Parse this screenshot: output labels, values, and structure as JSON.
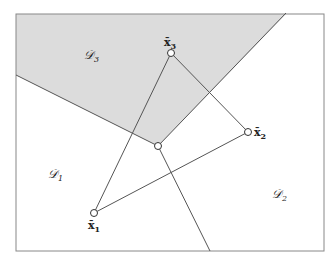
{
  "diagram": {
    "type": "voronoi-decision-regions",
    "frame": {
      "x1": 16,
      "y1": 14,
      "x2": 324,
      "y2": 251
    },
    "colors": {
      "shaded_region": "#dcdcdc",
      "line": "#555555",
      "frame": "#888888",
      "point_fill": "#ffffff"
    },
    "regions": [
      {
        "id": "D1",
        "label": "𝒟",
        "sub": "1",
        "x": 48,
        "y": 178,
        "shaded": false
      },
      {
        "id": "D2",
        "label": "𝒟",
        "sub": "2",
        "x": 272,
        "y": 198,
        "shaded": false
      },
      {
        "id": "D3",
        "label": "𝒟",
        "sub": "3",
        "x": 84,
        "y": 59,
        "shaded": true
      }
    ],
    "points": [
      {
        "id": "x1",
        "label": "x̄",
        "sub": "1",
        "x": 94,
        "y": 213,
        "label_x": 88,
        "label_y": 229
      },
      {
        "id": "x2",
        "label": "x̄",
        "sub": "2",
        "x": 248,
        "y": 132,
        "label_x": 254,
        "label_y": 136
      },
      {
        "id": "x3",
        "label": "x̄",
        "sub": "3",
        "x": 171,
        "y": 53,
        "label_x": 164,
        "label_y": 46
      }
    ],
    "center_vertex": {
      "x": 158,
      "y": 146
    },
    "boundaries": [
      {
        "from": [
          16,
          75
        ],
        "to": [
          158,
          146
        ]
      },
      {
        "from": [
          286,
          13
        ],
        "to": [
          158,
          146
        ]
      },
      {
        "from": [
          158,
          146
        ],
        "to": [
          210,
          251
        ]
      }
    ],
    "triangle_edges": [
      [
        "x1",
        "x3"
      ],
      [
        "x3",
        "x2"
      ],
      [
        "x2",
        "x1"
      ]
    ]
  }
}
